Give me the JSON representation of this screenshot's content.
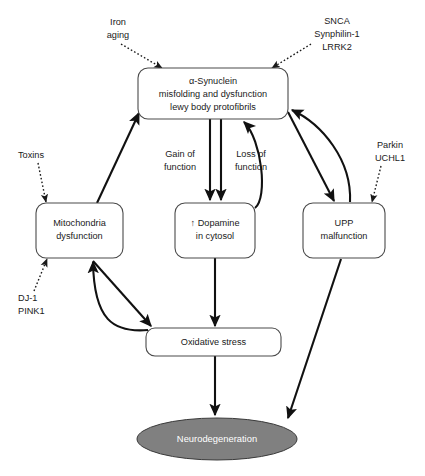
{
  "figure": {
    "background_color": "#ffffff",
    "node_fill": "#ffffff",
    "node_stroke": "#4a4a4a",
    "terminal_fill": "#808080",
    "terminal_text_color": "#ffffff",
    "edge_color": "#111111"
  },
  "nodes": {
    "synuclein": {
      "line1": "α-Synuclein",
      "line2": "misfolding and dysfunction",
      "line3": "lewy body protofibrils"
    },
    "mitochondria": {
      "line1": "Mitochondria",
      "line2": "dysfunction"
    },
    "dopamine": {
      "line1": "↑ Dopamine",
      "line2": "in cytosol"
    },
    "upp": {
      "line1": "UPP",
      "line2": "malfunction"
    },
    "oxidative": {
      "line1": "Oxidative stress"
    },
    "neurodegeneration": {
      "line1": "Neurodegeneration"
    }
  },
  "annotations": {
    "iron_aging": {
      "line1": "Iron",
      "line2": "aging"
    },
    "snca": {
      "line1": "SNCA",
      "line2": "Synphilin-1",
      "line3": "LRRK2"
    },
    "toxins": {
      "line1": "Toxins"
    },
    "dj1_pink1": {
      "line1": "DJ-1",
      "line2": "PINK1"
    },
    "parkin_uchl1": {
      "line1": "Parkin",
      "line2": "UCHL1"
    },
    "gain_of_function": {
      "line1": "Gain of",
      "line2": "function"
    },
    "loss_of_function": {
      "line1": "Loss of",
      "line2": "function"
    }
  }
}
